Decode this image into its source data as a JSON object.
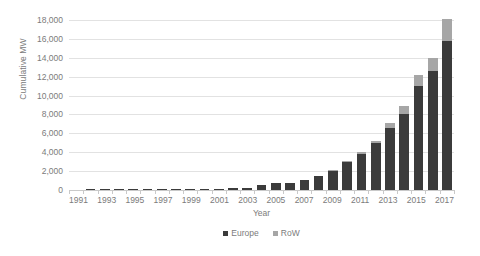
{
  "chart_data": {
    "type": "bar",
    "stacked": true,
    "title": "",
    "xlabel": "Year",
    "ylabel": "Cumulative MW",
    "ylim": [
      0,
      18000
    ],
    "ytick_step": 2000,
    "ytick_labels": [
      "18,000",
      "16,000",
      "14,000",
      "12,000",
      "10,000",
      "8,000",
      "6,000",
      "4,000",
      "2,000",
      "0"
    ],
    "ytick_values": [
      18000,
      16000,
      14000,
      12000,
      10000,
      8000,
      6000,
      4000,
      2000,
      0
    ],
    "grid": true,
    "legend_position": "bottom",
    "categories": [
      1991,
      1992,
      1993,
      1994,
      1995,
      1996,
      1997,
      1998,
      1999,
      2000,
      2001,
      2002,
      2003,
      2004,
      2005,
      2006,
      2007,
      2008,
      2009,
      2010,
      2011,
      2012,
      2013,
      2014,
      2015,
      2016,
      2017
    ],
    "xtick_labels": [
      "1991",
      "",
      "1993",
      "",
      "1995",
      "",
      "1997",
      "",
      "1999",
      "",
      "2001",
      "",
      "2003",
      "",
      "2005",
      "",
      "2007",
      "",
      "2009",
      "",
      "2011",
      "",
      "2013",
      "",
      "2015",
      "",
      "2017"
    ],
    "series": [
      {
        "name": "Europe",
        "color": "#3b3b3b",
        "values": [
          0,
          5,
          5,
          5,
          5,
          12,
          12,
          27,
          32,
          36,
          86,
          170,
          256,
          532,
          695,
          787,
          1106,
          1479,
          2060,
          2945,
          3813,
          4995,
          6562,
          8045,
          11030,
          12631,
          15780
        ]
      },
      {
        "name": "RoW",
        "color": "#a6a6a6",
        "values": [
          0,
          0,
          0,
          0,
          0,
          0,
          0,
          0,
          0,
          0,
          0,
          0,
          0,
          0,
          0,
          0,
          0,
          0,
          63,
          130,
          172,
          247,
          512,
          820,
          1100,
          1330,
          2290
        ]
      }
    ],
    "totals": [
      0,
      5,
      5,
      5,
      5,
      12,
      12,
      27,
      32,
      36,
      86,
      170,
      256,
      532,
      695,
      787,
      1106,
      1479,
      2123,
      3075,
      3985,
      5242,
      7074,
      8865,
      12130,
      13961,
      18070
    ],
    "legend": [
      "Europe",
      "RoW"
    ]
  }
}
